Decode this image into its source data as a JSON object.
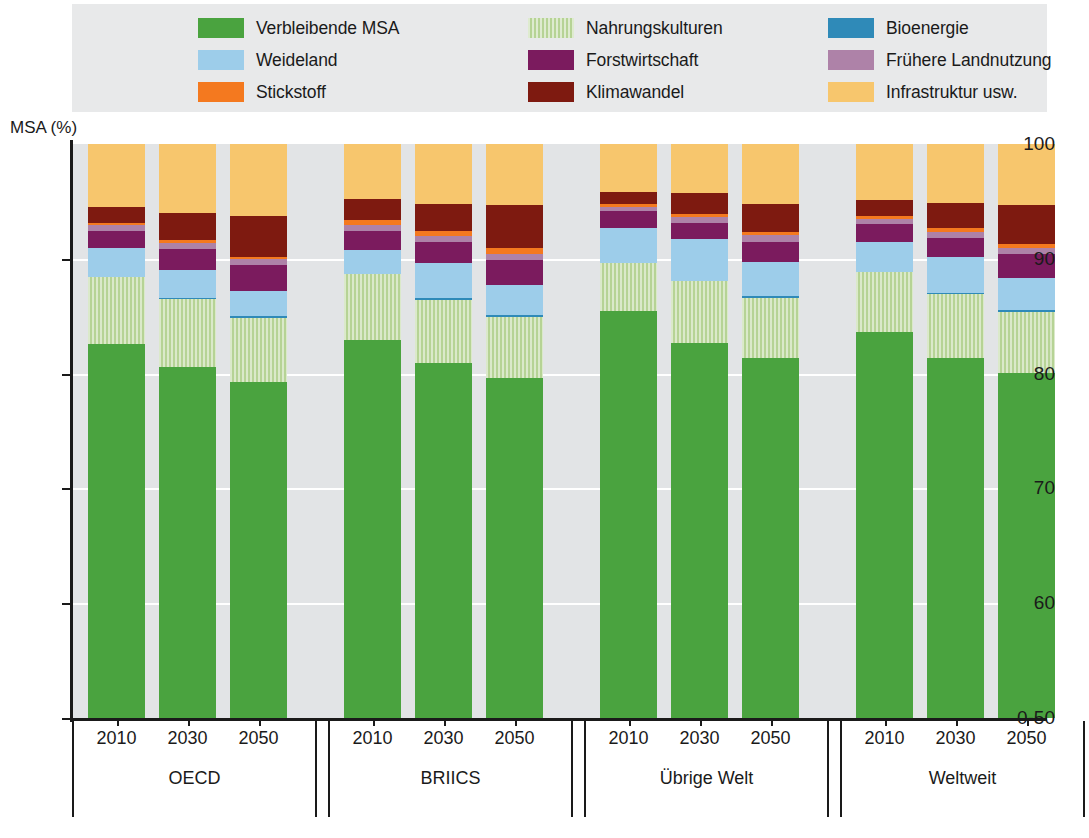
{
  "axis_title": "MSA (%)",
  "legend": {
    "items": [
      {
        "label": "Verbleibende MSA",
        "key": "remaining_msa",
        "color": "#4aa33f",
        "pattern": false
      },
      {
        "label": "Weideland",
        "key": "grazing",
        "color": "#9dcdea",
        "pattern": false
      },
      {
        "label": "Stickstoff",
        "key": "nitrogen",
        "color": "#f4791f",
        "pattern": false
      },
      {
        "label": "Nahrungskulturen",
        "key": "food_crops",
        "color": "#b6d395",
        "pattern": true
      },
      {
        "label": "Forstwirtschaft",
        "key": "forestry",
        "color": "#7b1b5e",
        "pattern": false
      },
      {
        "label": "Klimawandel",
        "key": "climate",
        "color": "#7e1a10",
        "pattern": false
      },
      {
        "label": "Bioenergie",
        "key": "bioenergy",
        "color": "#2f8ab8",
        "pattern": false
      },
      {
        "label": "Frühere Landnutzung",
        "key": "past_landuse",
        "color": "#ae82a8",
        "pattern": false
      },
      {
        "label": "Infrastruktur usw.",
        "key": "infrastructure",
        "color": "#f7c66d",
        "pattern": false
      }
    ]
  },
  "chart_data": {
    "type": "bar",
    "subtype": "stacked-bar",
    "title": "",
    "xlabel": "",
    "ylabel": "MSA (%)",
    "ylim": [
      50,
      100
    ],
    "y_axis_broken_at_bottom": true,
    "ytick_labels": [
      "100",
      "90",
      "80",
      "70",
      "60",
      "0-50"
    ],
    "ytick_values": [
      100,
      90,
      80,
      70,
      60,
      50
    ],
    "grid": true,
    "legend_position": "top",
    "stack_order_bottom_to_top": [
      "remaining_msa",
      "food_crops",
      "bioenergy",
      "grazing",
      "forestry",
      "past_landuse",
      "nitrogen",
      "climate",
      "infrastructure"
    ],
    "groups": [
      {
        "name": "OECD",
        "bars": [
          {
            "year": "2010",
            "segments": {
              "remaining_msa": 65.2,
              "food_crops": 11.7,
              "bioenergy": 0.0,
              "grazing": 4.9,
              "forestry": 3.1,
              "past_landuse": 0.9,
              "nitrogen": 0.4,
              "climate": 2.8,
              "infrastructure": 11.0
            }
          },
          {
            "year": "2030",
            "segments": {
              "remaining_msa": 61.2,
              "food_crops": 11.8,
              "bioenergy": 0.1,
              "grazing": 5.0,
              "forestry": 3.6,
              "past_landuse": 1.1,
              "nitrogen": 0.4,
              "climate": 4.8,
              "infrastructure": 12.0
            }
          },
          {
            "year": "2050",
            "segments": {
              "remaining_msa": 58.6,
              "food_crops": 11.0,
              "bioenergy": 0.5,
              "grazing": 4.3,
              "forestry": 4.6,
              "past_landuse": 0.9,
              "nitrogen": 0.4,
              "climate": 7.2,
              "infrastructure": 12.5
            }
          }
        ]
      },
      {
        "name": "BRIICS",
        "bars": [
          {
            "year": "2010",
            "segments": {
              "remaining_msa": 65.8,
              "food_crops": 11.5,
              "bioenergy": 0.0,
              "grazing": 4.3,
              "forestry": 3.3,
              "past_landuse": 1.0,
              "nitrogen": 0.8,
              "climate": 3.7,
              "infrastructure": 9.6
            }
          },
          {
            "year": "2030",
            "segments": {
              "remaining_msa": 61.9,
              "food_crops": 11.0,
              "bioenergy": 0.3,
              "grazing": 6.1,
              "forestry": 3.6,
              "past_landuse": 1.1,
              "nitrogen": 0.9,
              "climate": 4.7,
              "infrastructure": 10.4
            }
          },
          {
            "year": "2050",
            "segments": {
              "remaining_msa": 59.3,
              "food_crops": 10.5,
              "bioenergy": 0.4,
              "grazing": 5.2,
              "forestry": 4.4,
              "past_landuse": 1.1,
              "nitrogen": 1.0,
              "climate": 7.5,
              "infrastructure": 10.6
            }
          }
        ]
      },
      {
        "name": "Übrige Welt",
        "bars": [
          {
            "year": "2010",
            "segments": {
              "remaining_msa": 70.9,
              "food_crops": 8.3,
              "bioenergy": 0.0,
              "grazing": 6.1,
              "forestry": 3.0,
              "past_landuse": 0.8,
              "nitrogen": 0.4,
              "climate": 2.1,
              "infrastructure": 8.4
            }
          },
          {
            "year": "2030",
            "segments": {
              "remaining_msa": 65.3,
              "food_crops": 10.8,
              "bioenergy": 0.1,
              "grazing": 7.2,
              "forestry": 2.9,
              "past_landuse": 1.0,
              "nitrogen": 0.5,
              "climate": 3.7,
              "infrastructure": 8.5
            }
          },
          {
            "year": "2050",
            "segments": {
              "remaining_msa": 62.7,
              "food_crops": 10.5,
              "bioenergy": 0.4,
              "grazing": 5.8,
              "forestry": 3.5,
              "past_landuse": 1.2,
              "nitrogen": 0.6,
              "climate": 4.9,
              "infrastructure": 10.4
            }
          }
        ]
      },
      {
        "name": "Weltweit",
        "bars": [
          {
            "year": "2010",
            "segments": {
              "remaining_msa": 67.2,
              "food_crops": 10.5,
              "bioenergy": 0.0,
              "grazing": 5.2,
              "forestry": 3.1,
              "past_landuse": 0.9,
              "nitrogen": 0.5,
              "climate": 2.9,
              "infrastructure": 9.7
            }
          },
          {
            "year": "2030",
            "segments": {
              "remaining_msa": 62.7,
              "food_crops": 11.2,
              "bioenergy": 0.2,
              "grazing": 6.2,
              "forestry": 3.3,
              "past_landuse": 1.1,
              "nitrogen": 0.6,
              "climate": 4.4,
              "infrastructure": 10.3
            }
          },
          {
            "year": "2050",
            "segments": {
              "remaining_msa": 60.1,
              "food_crops": 10.6,
              "bioenergy": 0.4,
              "grazing": 5.5,
              "forestry": 4.2,
              "past_landuse": 1.1,
              "nitrogen": 0.7,
              "climate": 6.8,
              "infrastructure": 10.6
            }
          }
        ]
      }
    ]
  }
}
